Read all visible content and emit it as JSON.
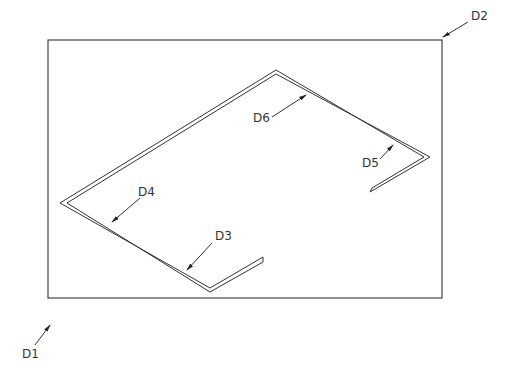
{
  "diagram": {
    "title": "",
    "labels": {
      "d1": "D1",
      "d2": "D2",
      "d3": "D3",
      "d4": "D4",
      "d5": "D5",
      "d6": "D6"
    },
    "colors": {
      "line": "#333333",
      "background": "#ffffff"
    }
  }
}
